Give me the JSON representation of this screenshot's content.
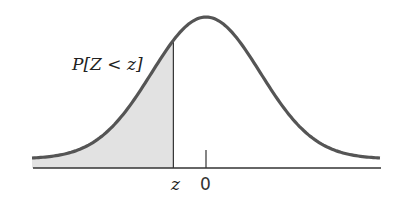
{
  "chart_data": {
    "type": "area",
    "title": "",
    "subtitle": "Standard normal density curve with shaded left-tail area",
    "xlabel": "",
    "ylabel": "",
    "x_tick_labels": [
      "z",
      "0"
    ],
    "annotations": [
      {
        "text": "P[Z < z]",
        "target": "shaded area left of z"
      }
    ],
    "series": [
      {
        "name": "standard normal pdf",
        "mean": 0,
        "sd": 1,
        "x_range": [
          -3.2,
          3.2
        ]
      }
    ],
    "shaded_region": {
      "from": -3.2,
      "to": -0.6,
      "label": "P[Z < z]"
    },
    "grid": false,
    "legend": null
  },
  "labels": {
    "annotation": "P[Z < z]",
    "z_tick": "z",
    "zero_tick": "0"
  },
  "colors": {
    "curve": "#555555",
    "shade": "#e2e2e2",
    "axis": "#333333"
  }
}
